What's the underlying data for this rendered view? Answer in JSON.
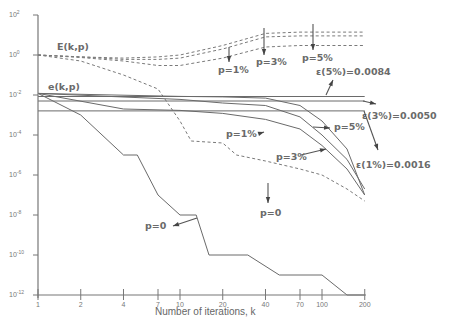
{
  "chart_data": {
    "type": "line",
    "title": "",
    "xlabel": "Number of iterations, k",
    "ylabel": "",
    "xscale": "log",
    "yscale": "log",
    "xlim": [
      1,
      200
    ],
    "ylim": [
      1e-12,
      100
    ],
    "grid": false,
    "x_ticks": [
      1,
      2,
      4,
      7,
      10,
      20,
      40,
      70,
      100,
      200
    ],
    "x_tick_labels": [
      "1",
      "2",
      "4",
      "7",
      "10",
      "20",
      "40",
      "70",
      "100",
      "200"
    ],
    "y_ticks": [
      100,
      1,
      0.01,
      0.0001,
      1e-06,
      1e-08,
      1e-10,
      1e-12
    ],
    "y_tick_labels": [
      "10^2",
      "10^0",
      "10^-2",
      "10^-4",
      "10^-6",
      "10^-8",
      "10^-10",
      "10^-12"
    ],
    "series": [
      {
        "name": "E(k,p) p=5%",
        "style": "dashed",
        "points": [
          [
            1,
            1
          ],
          [
            2,
            0.8
          ],
          [
            4,
            0.7
          ],
          [
            7,
            0.8
          ],
          [
            10,
            1
          ],
          [
            20,
            3
          ],
          [
            40,
            12
          ],
          [
            70,
            14
          ],
          [
            100,
            14
          ],
          [
            200,
            14
          ]
        ]
      },
      {
        "name": "E(k,p) p=3%",
        "style": "dashed",
        "points": [
          [
            1,
            1
          ],
          [
            2,
            0.8
          ],
          [
            4,
            0.6
          ],
          [
            7,
            0.6
          ],
          [
            10,
            0.7
          ],
          [
            20,
            2
          ],
          [
            40,
            8
          ],
          [
            70,
            9
          ],
          [
            100,
            9
          ],
          [
            200,
            9
          ]
        ]
      },
      {
        "name": "E(k,p) p=1%",
        "style": "dashed",
        "points": [
          [
            1,
            1
          ],
          [
            2,
            0.75
          ],
          [
            4,
            0.5
          ],
          [
            7,
            0.3
          ],
          [
            10,
            0.3
          ],
          [
            20,
            0.7
          ],
          [
            40,
            2.5
          ],
          [
            70,
            3
          ],
          [
            100,
            3
          ],
          [
            200,
            3
          ]
        ]
      },
      {
        "name": "E(k,p) p=0",
        "style": "dashed",
        "points": [
          [
            1,
            1
          ],
          [
            2,
            0.5
          ],
          [
            4,
            0.1
          ],
          [
            7,
            0.02
          ],
          [
            10,
            0.0005
          ],
          [
            12,
            5e-05
          ],
          [
            20,
            4e-05
          ],
          [
            25,
            1e-05
          ],
          [
            40,
            5e-06
          ],
          [
            70,
            2e-06
          ],
          [
            100,
            1e-06
          ],
          [
            150,
            2e-07
          ],
          [
            200,
            5e-08
          ]
        ]
      },
      {
        "name": "e(k,p) p=5%",
        "style": "solid",
        "points": [
          [
            1,
            0.012
          ],
          [
            10,
            0.0085
          ],
          [
            20,
            0.008
          ],
          [
            40,
            0.007
          ],
          [
            70,
            0.003
          ],
          [
            100,
            0.0005
          ],
          [
            150,
            2e-05
          ],
          [
            200,
            1e-07
          ]
        ]
      },
      {
        "name": "e(k,p) p=3%",
        "style": "solid",
        "points": [
          [
            1,
            0.012
          ],
          [
            10,
            0.006
          ],
          [
            20,
            0.004
          ],
          [
            40,
            0.003
          ],
          [
            70,
            0.0008
          ],
          [
            100,
            0.0001
          ],
          [
            150,
            6e-06
          ],
          [
            200,
            2e-07
          ]
        ]
      },
      {
        "name": "e(k,p) p=1%",
        "style": "solid",
        "points": [
          [
            1,
            0.012
          ],
          [
            4,
            0.002
          ],
          [
            10,
            0.0017
          ],
          [
            20,
            0.0012
          ],
          [
            40,
            0.0006
          ],
          [
            70,
            0.0002
          ],
          [
            100,
            3e-05
          ],
          [
            150,
            2e-06
          ],
          [
            200,
            1e-07
          ]
        ]
      },
      {
        "name": "e(k,p) p=0",
        "style": "solid",
        "points": [
          [
            1,
            0.012
          ],
          [
            2,
            0.001
          ],
          [
            4,
            1e-05
          ],
          [
            5,
            1e-05
          ],
          [
            7,
            1e-07
          ],
          [
            10,
            1e-08
          ],
          [
            13,
            1e-08
          ],
          [
            16,
            1e-10
          ],
          [
            30,
            1e-10
          ],
          [
            50,
            1e-11
          ],
          [
            100,
            1e-11
          ],
          [
            150,
            1e-12
          ],
          [
            200,
            1e-12
          ]
        ]
      },
      {
        "name": "ε(5%)=0.0084",
        "style": "solid",
        "points": [
          [
            1,
            0.0084
          ],
          [
            200,
            0.0084
          ]
        ]
      },
      {
        "name": "ε(3%)=0.0050",
        "style": "solid",
        "points": [
          [
            1,
            0.005
          ],
          [
            200,
            0.005
          ]
        ]
      },
      {
        "name": "ε(1%)=0.0016",
        "style": "solid",
        "points": [
          [
            1,
            0.0016
          ],
          [
            200,
            0.0016
          ]
        ]
      }
    ],
    "annotations": [
      {
        "text": "E(k,p)",
        "x": 57,
        "y": 50
      },
      {
        "text": "e(k,p)",
        "x": 48,
        "y": 90
      },
      {
        "text": "p=1%",
        "x": 218,
        "y": 73,
        "ax": 229,
        "ay": 47,
        "bx": 229,
        "by": 62
      },
      {
        "text": "p=3%",
        "x": 256,
        "y": 65,
        "ax": 264,
        "ay": 28,
        "bx": 264,
        "by": 55
      },
      {
        "text": "p=5%",
        "x": 302,
        "y": 61,
        "ax": 313,
        "ay": 24,
        "bx": 313,
        "by": 50
      },
      {
        "text": "ε(5%)=0.0084",
        "x": 316,
        "y": 75,
        "ax": 326,
        "ay": 95,
        "bx": 333,
        "by": 80
      },
      {
        "text": "ε(3%)=0.0050",
        "x": 362,
        "y": 119,
        "ax": 363,
        "ay": 101,
        "bx": 376,
        "by": 104
      },
      {
        "text": "p=5%",
        "x": 334,
        "y": 130,
        "ax": 313,
        "ay": 127,
        "bx": 330,
        "by": 128
      },
      {
        "text": "p=1%",
        "x": 226,
        "y": 137,
        "ax": 261,
        "ay": 133,
        "bx": 264,
        "by": 132
      },
      {
        "text": "p=3%",
        "x": 276,
        "y": 160,
        "ax": 301,
        "ay": 155,
        "bx": 326,
        "by": 149
      },
      {
        "text": "ε(1%)=0.0016",
        "x": 356,
        "y": 168,
        "ax": 364,
        "ay": 111,
        "bx": 378,
        "by": 150
      },
      {
        "text": "p=0",
        "x": 260,
        "y": 216,
        "ax": 268,
        "ay": 183,
        "bx": 268,
        "by": 203
      },
      {
        "text": "p=0",
        "x": 145,
        "y": 229,
        "ax": 197,
        "ay": 218,
        "bx": 173,
        "by": 226
      }
    ]
  }
}
